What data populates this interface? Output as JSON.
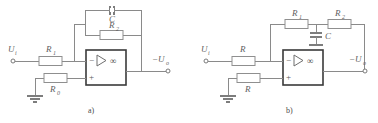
{
  "figure": {
    "background_color": "#ffffff",
    "wire_color": "#8a8a8a",
    "opamp_border_color": "#3a3a3a",
    "label_color": "#5f5f5f"
  },
  "circuit_a": {
    "caption": "a)",
    "input_terminal_label": "U",
    "input_terminal_sub": "i",
    "output_terminal_label": "−U",
    "output_terminal_sub": "o",
    "opamp": {
      "inverting_sign": "−",
      "noninverting_sign": "+",
      "gain_symbol": "∞"
    },
    "components": [
      {
        "name": "input-resistor",
        "label": "R",
        "sub": "1",
        "type": "resistor"
      },
      {
        "name": "feedback-resistor",
        "label": "R",
        "sub": "2",
        "type": "resistor"
      },
      {
        "name": "feedback-capacitor",
        "label": "C",
        "sub": "",
        "type": "capacitor"
      },
      {
        "name": "balance-resistor",
        "label": "R",
        "sub": "0",
        "type": "resistor"
      }
    ],
    "ground_label": ""
  },
  "circuit_b": {
    "caption": "b)",
    "input_terminal_label": "U",
    "input_terminal_sub": "i",
    "output_terminal_label": "−U",
    "output_terminal_sub": "o",
    "opamp": {
      "inverting_sign": "−",
      "noninverting_sign": "+",
      "gain_symbol": "∞"
    },
    "components": [
      {
        "name": "input-resistor",
        "label": "R",
        "sub": "",
        "type": "resistor"
      },
      {
        "name": "feedback-resistor-1",
        "label": "R",
        "sub": "1",
        "type": "resistor"
      },
      {
        "name": "feedback-resistor-2",
        "label": "R",
        "sub": "2",
        "type": "resistor"
      },
      {
        "name": "tee-capacitor",
        "label": "C",
        "sub": "",
        "type": "capacitor"
      },
      {
        "name": "balance-resistor",
        "label": "R",
        "sub": "",
        "type": "resistor"
      }
    ],
    "ground_label": ""
  }
}
